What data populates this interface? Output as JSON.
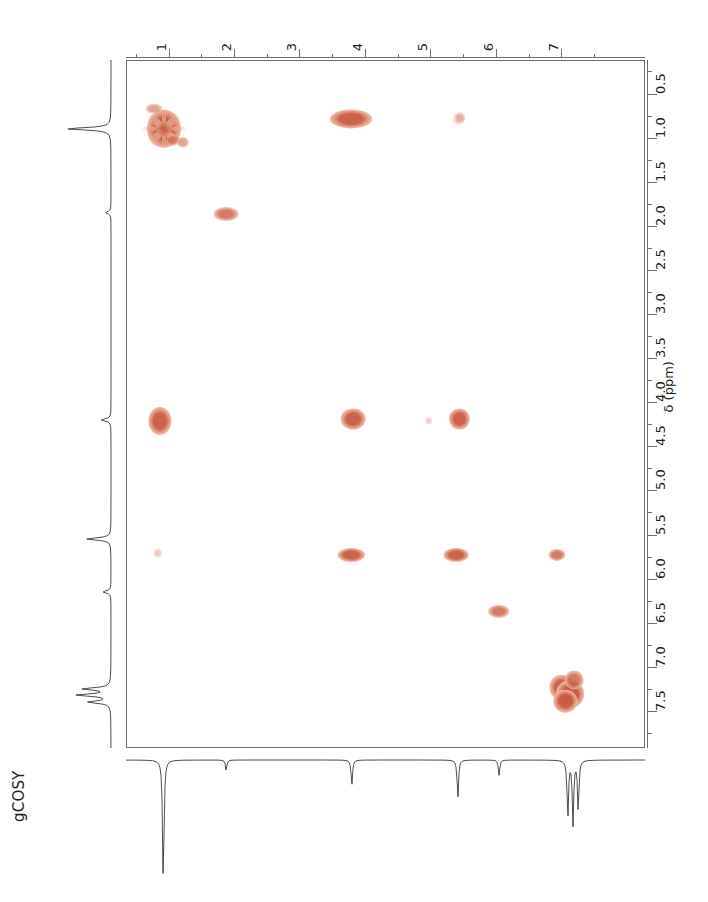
{
  "figure": {
    "experiment_label": "gCOSY",
    "width": 708,
    "height": 902
  },
  "colors": {
    "peak_core": "#c75b42",
    "peak_halo": "#e8a68f",
    "peak_faint": "#f0cfc4",
    "axis": "#6f6f6f",
    "trace": "#231f20",
    "background": "#ffffff"
  },
  "axes": {
    "top": {
      "name": "F2",
      "unit": "ppm",
      "direction": "left-to-right-increasing",
      "min": 0.35,
      "max": 8.28,
      "major_ticks": [
        1,
        2,
        3,
        4,
        5,
        6,
        7
      ],
      "major_tick_labels": [
        "1",
        "2",
        "3",
        "4",
        "5",
        "6",
        "7"
      ],
      "minor_ticks": [
        0.5,
        1.5,
        2.5,
        3.5,
        4.5,
        5.5,
        6.5,
        7.5
      ]
    },
    "right": {
      "name": "F1",
      "title": "δ (ppm)",
      "unit": "ppm",
      "direction": "top-to-bottom-increasing",
      "min": 0.12,
      "max": 7.92,
      "major_ticks": [
        0.5,
        1.0,
        1.5,
        2.0,
        2.5,
        3.0,
        3.5,
        4.0,
        4.5,
        5.0,
        5.5,
        6.0,
        6.5,
        7.0,
        7.5
      ],
      "major_tick_labels": [
        "0.5",
        "1.0",
        "1.5",
        "2.0",
        "2.5",
        "3.0",
        "3.5",
        "4.0",
        "4.5",
        "5.0",
        "5.5",
        "6.0",
        "6.5",
        "7.0",
        "7.5"
      ],
      "minor_ticks": [
        0.25,
        0.75,
        1.25,
        1.75,
        2.25,
        2.75,
        3.25,
        3.75,
        4.25,
        4.75,
        5.25,
        5.75,
        6.25,
        6.75,
        7.25,
        7.75
      ]
    }
  },
  "chart_data": {
    "type": "scatter",
    "title": "gCOSY",
    "xlabel": "δ (ppm)",
    "ylabel": "δ (ppm)",
    "xlim": [
      0.35,
      8.28
    ],
    "ylim": [
      7.92,
      0.12
    ],
    "grid": false,
    "legend": "none",
    "series": [
      {
        "name": "cross-peaks",
        "description": "2D COSY contour peaks; f2 = top axis ppm, f1 = right axis ppm",
        "points": [
          {
            "id": "d-0.90",
            "f2": 0.92,
            "f1": 0.89,
            "w": 22,
            "h": 22,
            "intensity": "very-strong",
            "kind": "diagonal",
            "star": true
          },
          {
            "id": "x-0.90/0.68",
            "f2": 0.76,
            "f1": 0.66,
            "w": 11,
            "h": 6,
            "intensity": "weak",
            "kind": "cross"
          },
          {
            "id": "x-1.05/1.02",
            "f2": 1.05,
            "f1": 1.02,
            "w": 9,
            "h": 6,
            "intensity": "weak",
            "kind": "cross"
          },
          {
            "id": "x-1.20/1.05",
            "f2": 1.2,
            "f1": 1.04,
            "w": 8,
            "h": 6,
            "intensity": "weak",
            "kind": "cross"
          },
          {
            "id": "x-3.80/0.78",
            "f2": 3.78,
            "f1": 0.78,
            "w": 27,
            "h": 11,
            "intensity": "strong",
            "kind": "cross"
          },
          {
            "id": "x-5.40/0.78",
            "f2": 5.42,
            "f1": 0.78,
            "w": 8,
            "h": 6,
            "intensity": "very-weak",
            "kind": "cross"
          },
          {
            "id": "d-1.85",
            "f2": 1.86,
            "f1": 1.86,
            "w": 16,
            "h": 8,
            "intensity": "medium",
            "kind": "diagonal"
          },
          {
            "id": "d-4.22-a",
            "f2": 0.85,
            "f1": 4.2,
            "w": 15,
            "h": 16,
            "intensity": "strong",
            "kind": "cross"
          },
          {
            "id": "x-3.80/4.18",
            "f2": 3.8,
            "f1": 4.18,
            "w": 16,
            "h": 12,
            "intensity": "strong",
            "kind": "cross"
          },
          {
            "id": "x-4.95/4.20",
            "f2": 4.96,
            "f1": 4.2,
            "w": 5,
            "h": 4,
            "intensity": "very-weak",
            "kind": "cross"
          },
          {
            "id": "x-5.42/4.18",
            "f2": 5.43,
            "f1": 4.18,
            "w": 13,
            "h": 12,
            "intensity": "strong",
            "kind": "cross"
          },
          {
            "id": "x-0.90/5.70",
            "f2": 0.82,
            "f1": 5.7,
            "w": 6,
            "h": 5,
            "intensity": "very-weak",
            "kind": "cross"
          },
          {
            "id": "x-3.80/5.72",
            "f2": 3.78,
            "f1": 5.72,
            "w": 17,
            "h": 8,
            "intensity": "strong",
            "kind": "cross"
          },
          {
            "id": "x-5.40/5.72",
            "f2": 5.38,
            "f1": 5.72,
            "w": 16,
            "h": 8,
            "intensity": "strong",
            "kind": "cross"
          },
          {
            "id": "x-6.95/5.72",
            "f2": 6.92,
            "f1": 5.72,
            "w": 11,
            "h": 7,
            "intensity": "medium",
            "kind": "cross"
          },
          {
            "id": "x-6.05/6.35",
            "f2": 6.03,
            "f1": 6.36,
            "w": 14,
            "h": 7,
            "intensity": "medium",
            "kind": "cross"
          },
          {
            "id": "x-5.42/0.78-faint",
            "f2": 5.44,
            "f1": 0.76,
            "w": 7,
            "h": 6,
            "intensity": "very-weak",
            "kind": "cross"
          },
          {
            "id": "d-7.30-a",
            "f2": 6.99,
            "f1": 7.22,
            "w": 16,
            "h": 14,
            "intensity": "strong",
            "kind": "diagonal"
          },
          {
            "id": "d-7.30-b",
            "f2": 7.12,
            "f1": 7.3,
            "w": 18,
            "h": 16,
            "intensity": "very-strong",
            "kind": "diagonal"
          },
          {
            "id": "d-7.30-c",
            "f2": 7.05,
            "f1": 7.38,
            "w": 15,
            "h": 13,
            "intensity": "strong",
            "kind": "diagonal"
          },
          {
            "id": "d-7.30-d",
            "f2": 7.18,
            "f1": 7.14,
            "w": 12,
            "h": 11,
            "intensity": "medium",
            "kind": "diagonal"
          }
        ]
      }
    ],
    "projection_f1": {
      "name": "left-1d-trace",
      "axis": "F1",
      "peaks_ppm": [
        0.9,
        1.85,
        4.2,
        5.55,
        6.15,
        7.25,
        7.32,
        7.4
      ],
      "peak_heights": [
        1.0,
        0.12,
        0.22,
        0.55,
        0.18,
        0.62,
        0.75,
        0.5
      ]
    },
    "projection_f2": {
      "name": "bottom-1d-trace",
      "axis": "F2",
      "peaks_ppm": [
        0.92,
        1.88,
        3.8,
        5.42,
        6.05,
        7.1,
        7.18,
        7.26
      ],
      "peak_heights": [
        1.0,
        0.08,
        0.2,
        0.3,
        0.12,
        0.45,
        0.5,
        0.4
      ]
    }
  }
}
